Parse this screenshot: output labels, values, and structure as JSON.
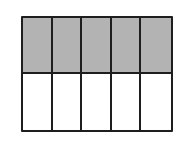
{
  "diagram": {
    "type": "fraction-grid",
    "rows": 2,
    "columns": 5,
    "shaded_cells": 5,
    "total_cells": 10,
    "colors": {
      "shaded": "#b3b3b3",
      "unshaded": "#ffffff",
      "line": "#1e1e1e"
    },
    "cells": [
      {
        "row": 0,
        "col": 0,
        "shaded": true
      },
      {
        "row": 0,
        "col": 1,
        "shaded": true
      },
      {
        "row": 0,
        "col": 2,
        "shaded": true
      },
      {
        "row": 0,
        "col": 3,
        "shaded": true
      },
      {
        "row": 0,
        "col": 4,
        "shaded": true
      },
      {
        "row": 1,
        "col": 0,
        "shaded": false
      },
      {
        "row": 1,
        "col": 1,
        "shaded": false
      },
      {
        "row": 1,
        "col": 2,
        "shaded": false
      },
      {
        "row": 1,
        "col": 3,
        "shaded": false
      },
      {
        "row": 1,
        "col": 4,
        "shaded": false
      }
    ]
  }
}
